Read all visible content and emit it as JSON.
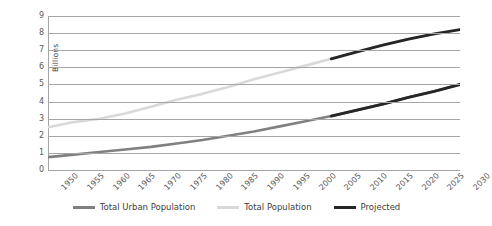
{
  "chart_data": {
    "type": "line",
    "title": "",
    "xlabel": "",
    "ylabel": "Billions",
    "xlim": [
      1950,
      2030
    ],
    "ylim": [
      0,
      9
    ],
    "grid": true,
    "legend_position": "bottom",
    "x": [
      1950,
      1955,
      1960,
      1965,
      1970,
      1975,
      1980,
      1985,
      1990,
      1995,
      2000,
      2005,
      2010,
      2015,
      2020,
      2025,
      2030
    ],
    "y_ticks": [
      0,
      1,
      2,
      3,
      4,
      5,
      6,
      7,
      8,
      9
    ],
    "x_tick_labels": [
      "1950",
      "1955",
      "1960",
      "1965",
      "1970",
      "1975",
      "1980",
      "1985",
      "1990",
      "1995",
      "2000",
      "2005",
      "2010",
      "2015",
      "2020",
      "2025",
      "2030"
    ],
    "projection_start_year": 2005,
    "series": [
      {
        "name": "Total Population",
        "color": "#d9d9d9",
        "values": [
          2.5,
          2.8,
          3.0,
          3.3,
          3.7,
          4.1,
          4.45,
          4.85,
          5.3,
          5.7,
          6.1,
          6.5,
          6.9,
          7.3,
          7.65,
          7.95,
          8.2
        ]
      },
      {
        "name": "Total Urban Population",
        "color": "#808080",
        "values": [
          0.75,
          0.9,
          1.05,
          1.2,
          1.35,
          1.55,
          1.75,
          2.0,
          2.25,
          2.55,
          2.85,
          3.15,
          3.5,
          3.85,
          4.25,
          4.6,
          5.0
        ]
      }
    ],
    "projected_segments": [
      {
        "name": "Projected Total Population",
        "color": "#262626",
        "x": [
          2005,
          2010,
          2015,
          2020,
          2025,
          2030
        ],
        "values": [
          6.5,
          6.9,
          7.3,
          7.65,
          7.95,
          8.2
        ]
      },
      {
        "name": "Projected Total Urban Population",
        "color": "#262626",
        "x": [
          2005,
          2010,
          2015,
          2020,
          2025,
          2030
        ],
        "values": [
          3.15,
          3.5,
          3.85,
          4.25,
          4.6,
          5.0
        ]
      }
    ]
  },
  "legend": {
    "items": [
      {
        "label": "Total Urban Population",
        "color": "#808080"
      },
      {
        "label": "Total Population",
        "color": "#d9d9d9"
      },
      {
        "label": "Projected",
        "color": "#262626"
      }
    ]
  },
  "colors": {
    "gridline": "#a6a6a6",
    "axis": "#a6a6a6",
    "tick_text": "#595959",
    "background": "#ffffff"
  }
}
